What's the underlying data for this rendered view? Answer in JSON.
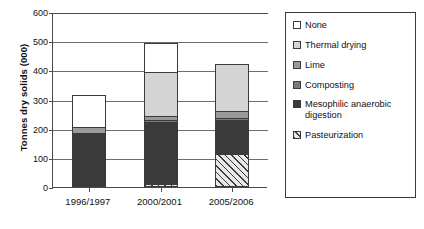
{
  "chart_data": {
    "type": "bar",
    "subtype": "stacked-bar",
    "title": "",
    "xlabel": "",
    "ylabel": "Tonnes dry solids (000)",
    "ylim": [
      0,
      600
    ],
    "yticks": [
      0,
      100,
      200,
      300,
      400,
      500,
      600
    ],
    "ytick_labels": [
      "0",
      "100",
      "200",
      "300",
      "400",
      "500",
      "600"
    ],
    "grid": true,
    "grid_axis": "y",
    "legend_position": "right",
    "categories": [
      "1996/1997",
      "2000/2001",
      "2005/2006"
    ],
    "stack_order_bottom_to_top": [
      "Pasteurization",
      "Mesophilic anaerobic digestion",
      "Composting",
      "Lime",
      "Thermal drying",
      "None"
    ],
    "series": [
      {
        "name": "Pasteurization",
        "fill": "hatched-diagonal",
        "color": "#e8e8e8",
        "values": [
          0,
          10,
          113
        ]
      },
      {
        "name": "Mesophilic anaerobic digestion",
        "fill": "solid",
        "color": "#3a3a3a",
        "values": [
          182,
          218,
          120
        ]
      },
      {
        "name": "Composting",
        "fill": "solid",
        "color": "#7a7a7a",
        "values": [
          8,
          8,
          10
        ]
      },
      {
        "name": "Lime",
        "fill": "solid",
        "color": "#9a9a9a",
        "values": [
          23,
          18,
          28
        ]
      },
      {
        "name": "Thermal drying",
        "fill": "solid",
        "color": "#d4d4d4",
        "values": [
          0,
          155,
          165
        ]
      },
      {
        "name": "None",
        "fill": "solid",
        "color": "#ffffff",
        "values": [
          112,
          103,
          0
        ]
      }
    ],
    "totals": [
      325,
      512,
      436
    ]
  },
  "axes": {
    "y_title": "Tonnes dry solids (000)",
    "y_tick_labels": [
      "600",
      "500",
      "400",
      "300",
      "200",
      "100",
      "0"
    ],
    "x_tick_labels": [
      "1996/1997",
      "2000/2001",
      "2005/2006"
    ]
  },
  "legend": {
    "items": [
      {
        "label": "None",
        "swatch": "swatch-none"
      },
      {
        "label": "Thermal drying",
        "swatch": "swatch-thermal-drying"
      },
      {
        "label": "Lime",
        "swatch": "swatch-lime"
      },
      {
        "label": "Composting",
        "swatch": "swatch-composting"
      },
      {
        "label": "Mesophilic anaerobic digestion",
        "swatch": "swatch-mesophilic-anaerobic-digestion"
      },
      {
        "label": "Pasteurization",
        "swatch": "swatch-pasteurization"
      }
    ]
  },
  "colors": {
    "none": "#ffffff",
    "thermal_drying": "#d4d4d4",
    "lime": "#9a9a9a",
    "composting": "#7a7a7a",
    "mesophilic": "#3a3a3a",
    "pasteurization": "#e8e8e8",
    "axis": "#4a4a4a",
    "grid": "#6e6e6e",
    "text": "#111111"
  }
}
